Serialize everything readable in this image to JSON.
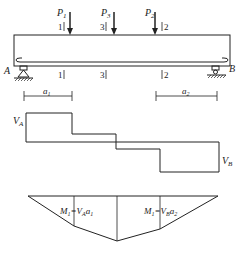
{
  "colors": {
    "ink": "#222222",
    "background": "#ffffff"
  },
  "loads": [
    {
      "label": "P",
      "sub": "1",
      "section": "1"
    },
    {
      "label": "P",
      "sub": "3",
      "section": "3"
    },
    {
      "label": "P",
      "sub": "2",
      "section": "2"
    }
  ],
  "supports": {
    "left": "A",
    "right": "B"
  },
  "sections": {
    "s1": "1",
    "s3": "3",
    "s2": "2"
  },
  "dimensions": {
    "a1": "a",
    "a1_sub": "1",
    "a2": "a",
    "a2_sub": "2"
  },
  "shear": {
    "va": "V",
    "va_sub": "A",
    "vb": "V",
    "vb_sub": "B"
  },
  "moment": {
    "m1_left": "M",
    "m1_left_sub": "1",
    "m1_left_eq": "=V",
    "m1_left_eq_sub": "A",
    "m1_left_a": "a",
    "m1_left_a_sub": "1",
    "m1_right": "M",
    "m1_right_sub": "1",
    "m1_right_eq": "=V",
    "m1_right_eq_sub": "B",
    "m1_right_a": "a",
    "m1_right_a_sub": "2"
  }
}
